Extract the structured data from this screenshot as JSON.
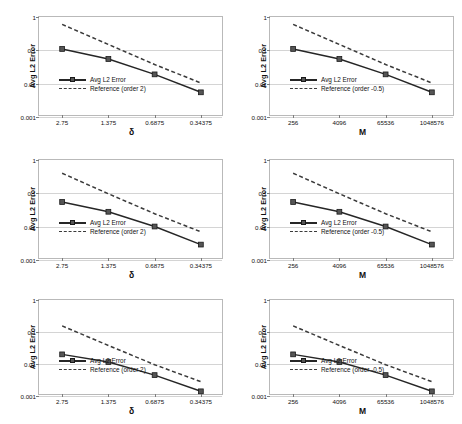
{
  "figure": {
    "panel_rows": 3,
    "panel_cols": 2,
    "background": "#ffffff",
    "series_color": "#262626",
    "reference_color": "#3a3a3a",
    "marker_color": "#555555",
    "gridline_color": "#d4d4d4",
    "frame_color": "#b9b9b9"
  },
  "labels": {
    "ylabel": "Avg L2 Error",
    "xlabel_delta": "δ",
    "xlabel_M": "M",
    "legend_series": "Avg L2 Error",
    "legend_ref_order2": "Reference (order 2)",
    "legend_ref_order_neg_half": "Reference (order -0.5)",
    "ytick_labels": [
      "1",
      "0.1",
      "0.01",
      "0.001"
    ],
    "xtick_labels_delta": [
      "2.75",
      "1.375",
      "0.6875",
      "0.34375"
    ],
    "xtick_labels_M": [
      "256",
      "4096",
      "65536",
      "1048576"
    ]
  },
  "chart_data": [
    {
      "id": "panel-r1c1",
      "type": "line",
      "title": "",
      "xlabel": "δ",
      "ylabel": "Avg L2 Error",
      "xscale": "log",
      "yscale": "log",
      "categories": [
        "2.75",
        "1.375",
        "0.6875",
        "0.34375"
      ],
      "x": [
        2.75,
        1.375,
        0.6875,
        0.34375
      ],
      "ylim": [
        0.001,
        1
      ],
      "yticks": [
        1,
        0.1,
        0.01,
        0.001
      ],
      "grid": true,
      "legend_position": "lower-left",
      "series": [
        {
          "name": "Avg L2 Error",
          "style": "solid-marker",
          "values": [
            0.11,
            0.055,
            0.019,
            0.0055
          ]
        },
        {
          "name": "Reference (order 2)",
          "style": "dashed",
          "values": [
            0.6,
            0.15,
            0.0375,
            0.0105
          ]
        }
      ]
    },
    {
      "id": "panel-r1c2",
      "type": "line",
      "title": "",
      "xlabel": "M",
      "ylabel": "Avg L2 Error",
      "xscale": "log",
      "yscale": "log",
      "categories": [
        "256",
        "4096",
        "65536",
        "1048576"
      ],
      "x": [
        256,
        4096,
        65536,
        1048576
      ],
      "ylim": [
        0.001,
        1
      ],
      "yticks": [
        1,
        0.1,
        0.01,
        0.001
      ],
      "grid": true,
      "legend_position": "lower-left",
      "series": [
        {
          "name": "Avg L2 Error",
          "style": "solid-marker",
          "values": [
            0.11,
            0.055,
            0.019,
            0.0055
          ]
        },
        {
          "name": "Reference (order -0.5)",
          "style": "dashed",
          "values": [
            0.6,
            0.15,
            0.0375,
            0.0105
          ]
        }
      ]
    },
    {
      "id": "panel-r2c1",
      "type": "line",
      "title": "",
      "xlabel": "δ",
      "ylabel": "Avg L2 Error",
      "xscale": "log",
      "yscale": "log",
      "categories": [
        "2.75",
        "1.375",
        "0.6875",
        "0.34375"
      ],
      "x": [
        2.75,
        1.375,
        0.6875,
        0.34375
      ],
      "ylim": [
        0.001,
        1
      ],
      "yticks": [
        1,
        0.1,
        0.01,
        0.001
      ],
      "grid": true,
      "legend_position": "lower-left",
      "series": [
        {
          "name": "Avg L2 Error",
          "style": "solid-marker",
          "values": [
            0.055,
            0.028,
            0.0101,
            0.0029
          ]
        },
        {
          "name": "Reference (order 2)",
          "style": "dashed",
          "values": [
            0.4,
            0.097,
            0.0245,
            0.007
          ]
        }
      ]
    },
    {
      "id": "panel-r2c2",
      "type": "line",
      "title": "",
      "xlabel": "M",
      "ylabel": "Avg L2 Error",
      "xscale": "log",
      "yscale": "log",
      "categories": [
        "256",
        "4096",
        "65536",
        "1048576"
      ],
      "x": [
        256,
        4096,
        65536,
        1048576
      ],
      "ylim": [
        0.001,
        1
      ],
      "yticks": [
        1,
        0.1,
        0.01,
        0.001
      ],
      "grid": true,
      "legend_position": "lower-left",
      "series": [
        {
          "name": "Avg L2 Error",
          "style": "solid-marker",
          "values": [
            0.055,
            0.028,
            0.0101,
            0.0029
          ]
        },
        {
          "name": "Reference (order -0.5)",
          "style": "dashed",
          "values": [
            0.4,
            0.097,
            0.0245,
            0.007
          ]
        }
      ]
    },
    {
      "id": "panel-r3c1",
      "type": "line",
      "title": "",
      "xlabel": "δ",
      "ylabel": "Avg L2 Error",
      "xscale": "log",
      "yscale": "log",
      "categories": [
        "2.75",
        "1.375",
        "0.6875",
        "0.34375"
      ],
      "x": [
        2.75,
        1.375,
        0.6875,
        0.34375
      ],
      "ylim": [
        0.001,
        1
      ],
      "yticks": [
        1,
        0.1,
        0.01,
        0.001
      ],
      "grid": true,
      "legend_position": "lower-left",
      "series": [
        {
          "name": "Avg L2 Error",
          "style": "solid-marker",
          "values": [
            0.02,
            0.0115,
            0.0045,
            0.0014
          ]
        },
        {
          "name": "Reference (order 2)",
          "style": "dashed",
          "values": [
            0.155,
            0.038,
            0.0095,
            0.0028
          ]
        }
      ]
    },
    {
      "id": "panel-r3c2",
      "type": "line",
      "title": "",
      "xlabel": "M",
      "ylabel": "Avg L2 Error",
      "xscale": "log",
      "yscale": "log",
      "categories": [
        "256",
        "4096",
        "65536",
        "1048576"
      ],
      "x": [
        256,
        4096,
        65536,
        1048576
      ],
      "ylim": [
        0.001,
        1
      ],
      "yticks": [
        1,
        0.1,
        0.01,
        0.001
      ],
      "grid": true,
      "legend_position": "lower-left",
      "series": [
        {
          "name": "Avg L2 Error",
          "style": "solid-marker",
          "values": [
            0.02,
            0.0115,
            0.0045,
            0.0014
          ]
        },
        {
          "name": "Reference (order -0.5)",
          "style": "dashed",
          "values": [
            0.155,
            0.038,
            0.0095,
            0.0028
          ]
        }
      ]
    }
  ]
}
